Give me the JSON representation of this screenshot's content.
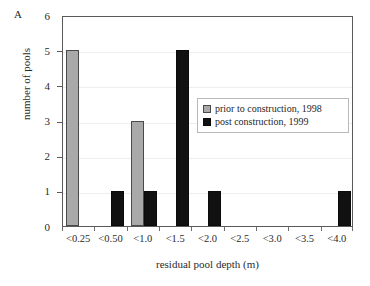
{
  "panel_label": "A",
  "chart_data": {
    "type": "bar",
    "title": "",
    "subtitle": "",
    "xlabel": "residual pool depth (m)",
    "ylabel": "number of pools",
    "categories": [
      "<0.25",
      "<0.50",
      "<1.0",
      "<1.5",
      "<2.0",
      "<2.5",
      "<3.0",
      "<3.5",
      "<4.0"
    ],
    "series": [
      {
        "name": "prior to construction, 1998",
        "color": "#a9a9a9",
        "values": [
          5,
          0,
          3,
          0,
          0,
          0,
          0,
          0,
          0
        ]
      },
      {
        "name": "post construction, 1999",
        "color": "#111111",
        "values": [
          0,
          1,
          1,
          5,
          1,
          0,
          0,
          0,
          1
        ]
      }
    ],
    "ylim": [
      0,
      6
    ],
    "y_ticks": [
      0,
      1,
      2,
      3,
      4,
      5,
      6
    ],
    "y_tick_labels": [
      "0",
      "1",
      "2",
      "3",
      "4",
      "5",
      "6"
    ],
    "grid": "horizontal-faint",
    "legend_position": "inside-right-center",
    "legend_border": true,
    "annotations": []
  },
  "legend": {
    "entries": [
      {
        "label": "prior to construction, 1998",
        "swatch": "gray-square-swatch"
      },
      {
        "label": "post construction, 1999",
        "swatch": "black-square-swatch"
      }
    ]
  }
}
